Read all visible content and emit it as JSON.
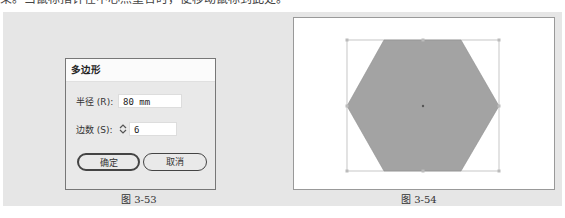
{
  "page": {
    "top_text": "束。当鼠标指针在中心点重合时，便移动鼠标到此处。"
  },
  "figure_left": {
    "caption": "图 3-53",
    "dialog": {
      "title": "多边形",
      "radius_label": "半径 (R):",
      "radius_value": "80 mm",
      "sides_label": "边数 (S):",
      "sides_value": "6",
      "ok_label": "确定",
      "cancel_label": "取消"
    }
  },
  "figure_right": {
    "caption": "图 3-54",
    "shape": "hexagon",
    "fill_color": "#a3a3a3",
    "bbox_color": "#b0b0b0"
  }
}
